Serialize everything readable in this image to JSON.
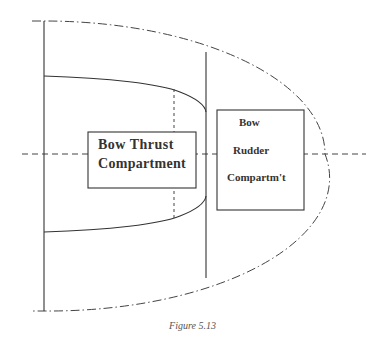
{
  "figure": {
    "caption": "Figure 5.13",
    "colors": {
      "line": "#444444",
      "background": "#ffffff",
      "caption": "#555555"
    }
  },
  "compartments": [
    {
      "id": "bow-thrust",
      "lines": [
        "Bow Thrust",
        "Compartment"
      ]
    },
    {
      "id": "bow-rudder",
      "lines": [
        "Bow",
        "Rudder",
        "Compartm't"
      ]
    }
  ],
  "line_styles": {
    "hull_outline": "dash-dot",
    "centerline": "dashed",
    "bulkheads": "solid",
    "inner_boundary": "solid",
    "thrust_tunnel_marker": "dotted"
  }
}
